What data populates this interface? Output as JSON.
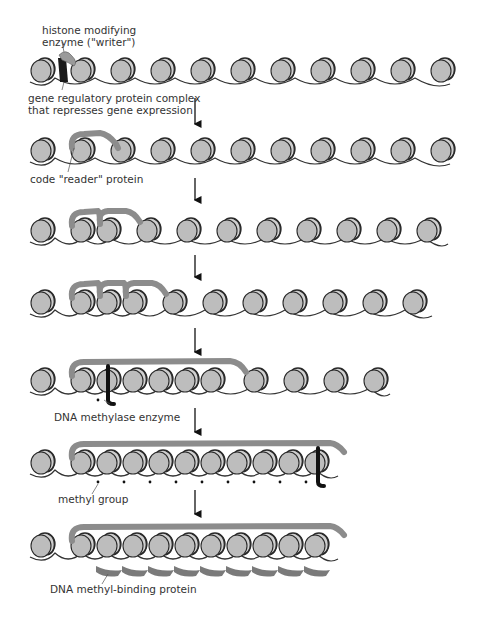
{
  "labels": {
    "writer_line1": "histone modifying",
    "writer_line2": "enzyme (\"writer\")",
    "repressor_line1": "gene regulatory protein complex",
    "repressor_line2": "that represses gene expression",
    "reader": "code \"reader\" protein",
    "methylase": "DNA methylase enzyme",
    "methyl_group": "methyl group",
    "methyl_binding": "DNA methyl-binding protein"
  },
  "colors": {
    "nucleosome": "#bdbdbd",
    "nucleosome_edge": "#2a2a2a",
    "dna": "#333333",
    "reader_protein": "#8c8c8c",
    "enzyme": "#111111",
    "arrow": "#111111"
  },
  "rows": [
    {
      "step": 1,
      "y": 70,
      "nucleosomes": 11,
      "compacted": 0,
      "end_x": 450
    },
    {
      "step": 2,
      "y": 150,
      "nucleosomes": 11,
      "compacted": 1,
      "end_x": 450
    },
    {
      "step": 3,
      "y": 230,
      "nucleosomes": 11,
      "compacted": 2,
      "end_x": 448
    },
    {
      "step": 4,
      "y": 302,
      "nucleosomes": 11,
      "compacted": 3,
      "end_x": 432
    },
    {
      "step": 5,
      "y": 380,
      "nucleosomes": 10,
      "compacted": 6,
      "end_x": 390
    },
    {
      "step": 6,
      "y": 462,
      "nucleosomes": 11,
      "compacted": 10,
      "end_x": 338
    },
    {
      "step": 7,
      "y": 545,
      "nucleosomes": 11,
      "compacted": 10,
      "end_x": 338
    }
  ],
  "arrows_x": 195
}
